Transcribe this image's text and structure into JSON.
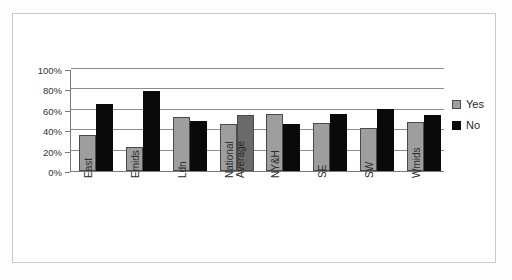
{
  "chart_data": {
    "type": "bar",
    "title": "",
    "xlabel": "",
    "ylabel": "",
    "ylim": [
      0,
      100
    ],
    "ytick_labels": [
      "100%",
      "80%",
      "60%",
      "40%",
      "20%",
      "0%"
    ],
    "ytick_values": [
      100,
      80,
      60,
      40,
      20,
      0
    ],
    "grid": true,
    "legend_position": "right",
    "categories": [
      "East",
      "Emids",
      "Ldn",
      "National Average",
      "NY&H",
      "SE",
      "SW",
      "Wmids"
    ],
    "category_lines": [
      [
        "East"
      ],
      [
        "Emids"
      ],
      [
        "Ldn"
      ],
      [
        "National",
        "Average"
      ],
      [
        "NY&H"
      ],
      [
        "SE"
      ],
      [
        "SW"
      ],
      [
        "Wmids"
      ]
    ],
    "series": [
      {
        "name": "Yes",
        "color": "#9e9e9e",
        "values": [
          35,
          24,
          53,
          46,
          56,
          47,
          42,
          48
        ]
      },
      {
        "name": "No",
        "color": "#0a0a0a",
        "values": [
          66,
          78,
          49,
          55,
          46,
          56,
          61,
          55
        ]
      }
    ]
  },
  "legend": {
    "entries": [
      {
        "label": "Yes",
        "swatch": "gray-swatch-icon"
      },
      {
        "label": "No",
        "swatch": "black-swatch-icon"
      }
    ]
  },
  "colors": {
    "series_yes": "#9e9e9e",
    "series_no": "#0a0a0a",
    "gridline": "#8c8c8c",
    "axis": "#7a7a7a",
    "frame": "#c9c9c9",
    "background": "#ffffff"
  }
}
